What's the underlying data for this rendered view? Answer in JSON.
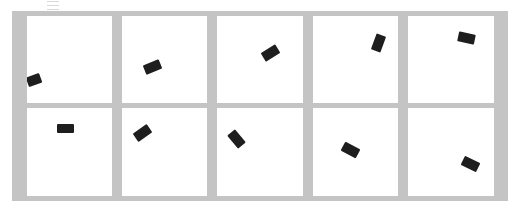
{
  "toolbar": {
    "icon": "menu-icon"
  },
  "grid": {
    "rows": 2,
    "columns": 5,
    "frame_color": "#c4c4c4",
    "cell_color": "#ffffff",
    "block_color": "#1e1e1e"
  },
  "frames": [
    {
      "index": 1,
      "row": 1,
      "col": 1,
      "block": {
        "x": 0,
        "y": 59,
        "w": 14,
        "h": 10,
        "angle": -20
      }
    },
    {
      "index": 2,
      "row": 1,
      "col": 2,
      "block": {
        "x": 22,
        "y": 46,
        "w": 17,
        "h": 10,
        "angle": -22
      }
    },
    {
      "index": 3,
      "row": 1,
      "col": 3,
      "block": {
        "x": 45,
        "y": 32,
        "w": 17,
        "h": 10,
        "angle": -32
      }
    },
    {
      "index": 4,
      "row": 1,
      "col": 4,
      "block": {
        "x": 57,
        "y": 22,
        "w": 17,
        "h": 10,
        "angle": -70
      }
    },
    {
      "index": 5,
      "row": 1,
      "col": 5,
      "block": {
        "x": 50,
        "y": 17,
        "w": 17,
        "h": 10,
        "angle": 12
      }
    },
    {
      "index": 6,
      "row": 2,
      "col": 1,
      "block": {
        "x": 30,
        "y": 16,
        "w": 17,
        "h": 9,
        "angle": 0
      }
    },
    {
      "index": 7,
      "row": 2,
      "col": 2,
      "block": {
        "x": 12,
        "y": 20,
        "w": 17,
        "h": 10,
        "angle": -35
      }
    },
    {
      "index": 8,
      "row": 2,
      "col": 3,
      "block": {
        "x": 11,
        "y": 26,
        "w": 17,
        "h": 10,
        "angle": 50
      }
    },
    {
      "index": 9,
      "row": 2,
      "col": 4,
      "block": {
        "x": 29,
        "y": 37,
        "w": 17,
        "h": 10,
        "angle": 28
      }
    },
    {
      "index": 10,
      "row": 2,
      "col": 5,
      "block": {
        "x": 54,
        "y": 51,
        "w": 17,
        "h": 10,
        "angle": 26
      }
    }
  ]
}
